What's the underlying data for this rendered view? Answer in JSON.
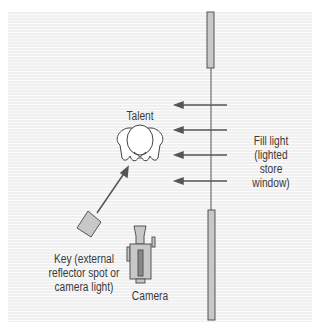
{
  "diagram": {
    "labels": {
      "talent": "Talent",
      "fill_light": [
        "Fill light",
        "(lighted",
        "store",
        "window)"
      ],
      "key": [
        "Key (external",
        "reflector spot or",
        "camera light)"
      ],
      "camera": "Camera"
    },
    "colors": {
      "background_stripe_dark": "#efefef",
      "background_stripe_light": "#fbfbfb",
      "line": "#555555",
      "fill_gray": "#c8c8c8",
      "text": "#3a3a3a"
    }
  }
}
